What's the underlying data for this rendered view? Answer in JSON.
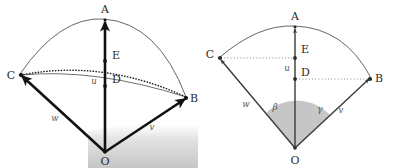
{
  "figure": {
    "panels": [
      {
        "id": "left-panel",
        "name": "perspective-sphere-view",
        "origin_label": "O",
        "vertex_labels": [
          "A",
          "B",
          "C"
        ],
        "interior_labels": [
          "E",
          "D"
        ],
        "vector_labels": [
          "u",
          "v",
          "w"
        ],
        "ground_shading": true,
        "angle_labels": []
      },
      {
        "id": "right-panel",
        "name": "flattened-sector-view",
        "origin_label": "O",
        "vertex_labels": [
          "A",
          "B",
          "C"
        ],
        "interior_labels": [
          "E",
          "D"
        ],
        "vector_labels": [
          "u",
          "v",
          "w"
        ],
        "ground_shading": false,
        "angle_labels": [
          "β",
          "γ"
        ]
      }
    ]
  },
  "left": {
    "point_A": "A",
    "point_B": "B",
    "point_C": "C",
    "point_D": "D",
    "point_E": "E",
    "point_O": "O",
    "vec_u": "u",
    "vec_v": "v",
    "vec_w": "w"
  },
  "right": {
    "point_A": "A",
    "point_B": "B",
    "point_C": "C",
    "point_D": "D",
    "point_E": "E",
    "point_O": "O",
    "vec_u": "u",
    "vec_v": "v",
    "vec_w": "w",
    "angle_beta": "β",
    "angle_gamma": "γ"
  },
  "colors": {
    "stroke_heavy": "#111111",
    "stroke_light": "#4a4a4a",
    "dotted": "#333333",
    "label": "#2b2b2b",
    "label_italic": "#555555",
    "ground_top": "#ffffff",
    "ground_bottom": "#c9c9c9",
    "sector_fill": "#c3c3c3"
  }
}
